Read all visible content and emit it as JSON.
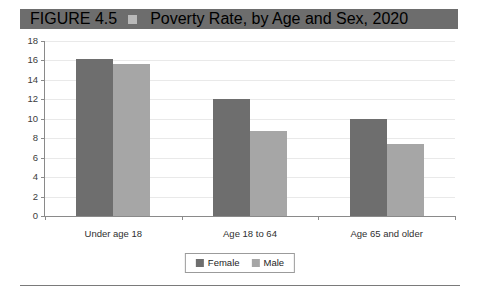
{
  "figure": {
    "number_label": "FIGURE 4.5",
    "marker_icon": "square-marker-icon",
    "title": "Poverty Rate, by Age and Sex, 2020"
  },
  "legend": {
    "position": "bottom-center",
    "entries": [
      {
        "label": "Female",
        "color": "#6e6e6e"
      },
      {
        "label": "Male",
        "color": "#a6a6a6"
      }
    ]
  },
  "colors": {
    "title_bar_background": "#6d6d6d",
    "title_text": "#ffffff",
    "title_marker": "#b9b9b9",
    "female_bar": "#6e6e6e",
    "male_bar": "#a6a6a6",
    "gridline": "#e9e9e9",
    "axis": "#8a8a8a",
    "bottom_rule": "#7a7a7a"
  },
  "chart_data": {
    "type": "bar",
    "title": "Poverty Rate, by Age and Sex, 2020",
    "xlabel": "",
    "ylabel": "",
    "categories": [
      "Under age 18",
      "Age 18 to 64",
      "Age 65 and older"
    ],
    "series": [
      {
        "name": "Female",
        "color": "#6e6e6e",
        "values": [
          16.2,
          12.0,
          10.0
        ]
      },
      {
        "name": "Male",
        "color": "#a6a6a6",
        "values": [
          15.6,
          8.7,
          7.4
        ]
      }
    ],
    "ylim": [
      0,
      18
    ],
    "ytick_labels": [
      "18",
      "16",
      "14",
      "12",
      "10",
      "8",
      "6",
      "4",
      "2",
      "0"
    ],
    "ytick_values": [
      18,
      16,
      14,
      12,
      10,
      8,
      6,
      4,
      2,
      0
    ],
    "grid": true,
    "grid_axis": "y",
    "legend": [
      "Female",
      "Male"
    ]
  }
}
